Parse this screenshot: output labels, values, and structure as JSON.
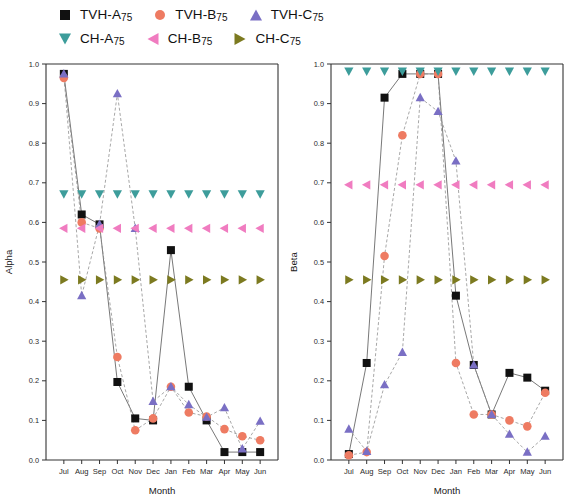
{
  "legend": {
    "rows": [
      [
        {
          "label": "TVH-A",
          "sub": "75",
          "marker": "square",
          "color": "#111111",
          "key": "tvh_a"
        },
        {
          "label": "TVH-B",
          "sub": "75",
          "marker": "circle",
          "color": "#ee7b62",
          "key": "tvh_b"
        },
        {
          "label": "TVH-C",
          "sub": "75",
          "marker": "triangle-up",
          "color": "#7a6fc4",
          "key": "tvh_c"
        }
      ],
      [
        {
          "label": "CH-A",
          "sub": "75",
          "marker": "triangle-down",
          "color": "#3d9d9b",
          "key": "ch_a"
        },
        {
          "label": "CH-B",
          "sub": "75",
          "marker": "triangle-left",
          "color": "#f07cc0",
          "key": "ch_b"
        },
        {
          "label": "CH-C",
          "sub": "75",
          "marker": "triangle-right",
          "color": "#7c7a20",
          "key": "ch_c"
        }
      ]
    ]
  },
  "chart_data": [
    {
      "type": "scatter",
      "id": "alpha",
      "title": "",
      "xlabel": "Month",
      "ylabel": "Alpha",
      "categories": [
        "Jul",
        "Aug",
        "Sep",
        "Oct",
        "Nov",
        "Dec",
        "Jan",
        "Feb",
        "Mar",
        "Apr",
        "May",
        "Jun"
      ],
      "xlim": [
        0,
        13
      ],
      "ylim": [
        0.0,
        1.0
      ],
      "ytick_labels": [
        "0.0",
        "0.1",
        "0.2",
        "0.3",
        "0.4",
        "0.5",
        "0.6",
        "0.7",
        "0.8",
        "0.9",
        "1.0"
      ],
      "ytick_values": [
        0.0,
        0.1,
        0.2,
        0.3,
        0.4,
        0.5,
        0.6,
        0.7,
        0.8,
        0.9,
        1.0
      ],
      "grid": false,
      "legend_position": "above",
      "series": [
        {
          "name": "TVH-A75",
          "marker": "square",
          "color": "#111111",
          "values": [
            0.975,
            0.62,
            0.595,
            0.197,
            0.105,
            0.1,
            0.53,
            0.185,
            0.1,
            0.02,
            0.02,
            0.02
          ],
          "connected": true
        },
        {
          "name": "TVH-B75",
          "marker": "circle",
          "color": "#ee7b62",
          "values": [
            0.965,
            0.6,
            0.585,
            0.26,
            0.075,
            0.105,
            0.185,
            0.12,
            0.11,
            0.078,
            0.06,
            0.05
          ],
          "connected": true
        },
        {
          "name": "TVH-C75",
          "marker": "triangle-up",
          "color": "#7a6fc4",
          "values": [
            0.975,
            0.415,
            0.595,
            0.925,
            0.585,
            0.148,
            0.185,
            0.14,
            0.108,
            0.132,
            0.028,
            0.098
          ],
          "connected": true
        },
        {
          "name": "CH-A75",
          "marker": "triangle-down",
          "color": "#3d9d9b",
          "values": [
            0.672,
            0.672,
            0.672,
            0.672,
            0.672,
            0.672,
            0.672,
            0.672,
            0.672,
            0.672,
            0.672,
            0.672
          ],
          "connected": false
        },
        {
          "name": "CH-B75",
          "marker": "triangle-left",
          "color": "#f07cc0",
          "values": [
            0.585,
            0.585,
            0.585,
            0.585,
            0.585,
            0.585,
            0.585,
            0.585,
            0.585,
            0.585,
            0.585,
            0.585
          ],
          "connected": false
        },
        {
          "name": "CH-C75",
          "marker": "triangle-right",
          "color": "#7c7a20",
          "values": [
            0.455,
            0.455,
            0.455,
            0.455,
            0.455,
            0.455,
            0.455,
            0.455,
            0.455,
            0.455,
            0.455,
            0.455
          ],
          "connected": false
        }
      ]
    },
    {
      "type": "scatter",
      "id": "beta",
      "title": "",
      "xlabel": "Month",
      "ylabel": "Beta",
      "categories": [
        "Jul",
        "Aug",
        "Sep",
        "Oct",
        "Nov",
        "Dec",
        "Jan",
        "Feb",
        "Mar",
        "Apr",
        "May",
        "Jun"
      ],
      "xlim": [
        0,
        13
      ],
      "ylim": [
        0.0,
        1.0
      ],
      "ytick_labels": [
        "0.0",
        "0.1",
        "0.2",
        "0.3",
        "0.4",
        "0.5",
        "0.6",
        "0.7",
        "0.8",
        "0.9",
        "1.0"
      ],
      "ytick_values": [
        0.0,
        0.1,
        0.2,
        0.3,
        0.4,
        0.5,
        0.6,
        0.7,
        0.8,
        0.9,
        1.0
      ],
      "grid": false,
      "legend_position": "above",
      "series": [
        {
          "name": "TVH-A75",
          "marker": "square",
          "color": "#111111",
          "values": [
            0.015,
            0.245,
            0.915,
            0.975,
            0.975,
            0.975,
            0.415,
            0.24,
            0.115,
            0.22,
            0.208,
            0.175
          ],
          "connected": true
        },
        {
          "name": "TVH-B75",
          "marker": "circle",
          "color": "#ee7b62",
          "values": [
            0.012,
            0.02,
            0.515,
            0.82,
            0.975,
            0.975,
            0.245,
            0.115,
            0.115,
            0.1,
            0.085,
            0.17
          ],
          "connected": true
        },
        {
          "name": "TVH-C75",
          "marker": "triangle-up",
          "color": "#7a6fc4",
          "values": [
            0.078,
            0.022,
            0.19,
            0.272,
            0.915,
            0.88,
            0.755,
            0.24,
            0.115,
            0.065,
            0.02,
            0.06
          ],
          "connected": true
        },
        {
          "name": "CH-A75",
          "marker": "triangle-down",
          "color": "#3d9d9b",
          "values": [
            0.982,
            0.982,
            0.982,
            0.982,
            0.982,
            0.982,
            0.982,
            0.982,
            0.982,
            0.982,
            0.982,
            0.982
          ],
          "connected": false
        },
        {
          "name": "CH-B75",
          "marker": "triangle-left",
          "color": "#f07cc0",
          "values": [
            0.695,
            0.695,
            0.695,
            0.695,
            0.695,
            0.695,
            0.695,
            0.695,
            0.695,
            0.695,
            0.695,
            0.695
          ],
          "connected": false
        },
        {
          "name": "CH-C75",
          "marker": "triangle-right",
          "color": "#7c7a20",
          "values": [
            0.455,
            0.455,
            0.455,
            0.455,
            0.455,
            0.455,
            0.455,
            0.455,
            0.455,
            0.455,
            0.455,
            0.455
          ],
          "connected": false
        }
      ]
    }
  ]
}
